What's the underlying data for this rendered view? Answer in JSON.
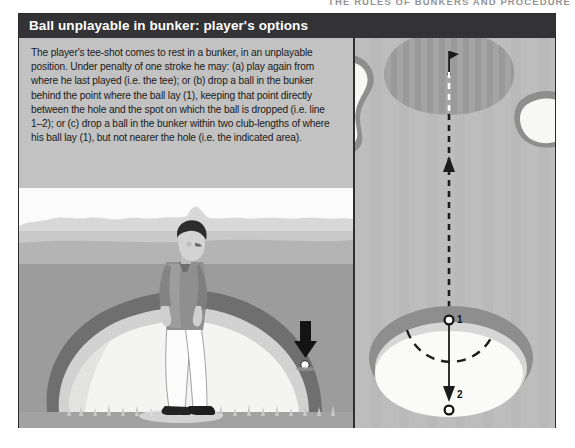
{
  "running_head": {
    "text": "THE RULES OF BUNKERS AND PROCEDURE"
  },
  "figure": {
    "title": "Ball unplayable in bunker: player's options",
    "caption": "The player's tee-shot comes to rest in a bunker, in an unplayable position. Under penalty of one stroke he may: (a) play again from where he last played (i.e. the tee); or (b) drop a ball in the bunker behind the point where the ball lay (1), keeping that point directly between the hole and the spot on which the ball is dropped (i.e. line 1–2); or (c) drop a ball in the bunker within two club-lengths of where his ball lay (1), but not nearer the hole (i.e. the indicated area).",
    "left_panel": {
      "name": "bunker-side-view",
      "elements": {
        "golfer": "golfer-standing",
        "ball": "golf-ball",
        "pointer": "down-arrow-to-ball",
        "bunker": "sand-bunker",
        "sky": "sky-and-treeline"
      }
    },
    "right_panel": {
      "name": "hole-plan-view",
      "marker_1": "1",
      "marker_2": "2",
      "elements": {
        "green": "putting-green",
        "flag": "hole-flagstick",
        "bunkers": "greenside-bunkers",
        "line_1_2": "dashed-line-to-hole",
        "relief_arc": "two-club-lengths-arc"
      }
    }
  },
  "colors": {
    "title_bar": "#333336",
    "title_text": "#ffffff",
    "frame_border": "#2b2b2b",
    "page_background": "#ffffff",
    "panel_background": "#c0c0c0",
    "sand": "#f2f2f0",
    "rough": "#8e8e8e",
    "fairway": "#b0b0b0",
    "green": "#a8a8a8",
    "marker": "#111111"
  }
}
